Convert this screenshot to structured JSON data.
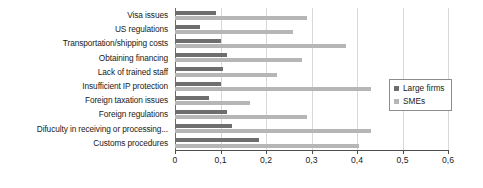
{
  "chart_data": {
    "type": "bar",
    "orientation": "horizontal",
    "title": "",
    "xlabel": "",
    "ylabel": "",
    "xlim": [
      0,
      0.6
    ],
    "xticks": [
      0,
      0.1,
      0.2,
      0.3,
      0.4,
      0.5,
      0.6
    ],
    "xtick_labels": [
      "0",
      "0,1",
      "0,2",
      "0,3",
      "0,4",
      "0,5",
      "0,6"
    ],
    "grid": true,
    "grid_axis": "x",
    "legend_position": "right",
    "categories": [
      "Visa issues",
      "US regulations",
      "Transportation/shipping costs",
      "Obtaining financing",
      "Lack of trained staff",
      "Insufficient IP protection",
      "Foreign taxation issues",
      "Foreign regulations",
      "Difuculty in receiving or processing...",
      "Customs procedures"
    ],
    "series": [
      {
        "name": "Large firms",
        "color": "#6e6e6e",
        "values": [
          0.09,
          0.055,
          0.1,
          0.115,
          0.105,
          0.1,
          0.075,
          0.115,
          0.125,
          0.185
        ]
      },
      {
        "name": "SMEs",
        "color": "#b6b6b6",
        "values": [
          0.29,
          0.26,
          0.375,
          0.28,
          0.225,
          0.43,
          0.165,
          0.29,
          0.43,
          0.405
        ]
      }
    ]
  },
  "legend": {
    "entries": [
      {
        "label": "Large firms",
        "swatch": "legend-swatch-large-firms"
      },
      {
        "label": "SMEs",
        "swatch": "legend-swatch-smes"
      }
    ]
  }
}
